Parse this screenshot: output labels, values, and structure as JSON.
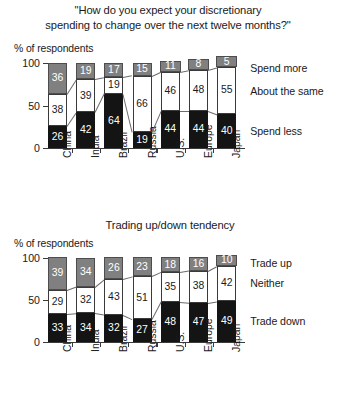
{
  "chart_data": [
    {
      "type": "bar",
      "id": "discretionary-spending",
      "title": "\"How do you expect your discretionary spending to change over the next twelve months?\"",
      "title_lines": [
        "\"How do you expect your discretionary",
        "spending to change over the next twelve months?\""
      ],
      "ylabel": "% of respondents",
      "xlabel": "",
      "ylim": [
        0,
        100
      ],
      "yticks": [
        0,
        50,
        100
      ],
      "ytick_labels": [
        "0",
        "50",
        "100"
      ],
      "grid": false,
      "stacked": true,
      "legend_position": "right",
      "categories": [
        "China",
        "India",
        "Brazil",
        "Russia",
        "U.S.",
        "Europe",
        "Japan"
      ],
      "series": [
        {
          "name": "Spend less",
          "color": "#141414",
          "values": [
            26,
            42,
            64,
            19,
            44,
            44,
            40
          ]
        },
        {
          "name": "About the same",
          "color": "#ffffff",
          "values": [
            38,
            39,
            19,
            66,
            46,
            48,
            55
          ]
        },
        {
          "name": "Spend more",
          "color": "#808080",
          "values": [
            36,
            19,
            17,
            15,
            11,
            8,
            5
          ]
        }
      ]
    },
    {
      "type": "bar",
      "id": "trading-tendency",
      "title": "Trading up/down tendency",
      "title_lines": [
        "Trading up/down tendency"
      ],
      "ylabel": "% of respondents",
      "xlabel": "",
      "ylim": [
        0,
        100
      ],
      "yticks": [
        0,
        50,
        100
      ],
      "ytick_labels": [
        "0",
        "50",
        "100"
      ],
      "grid": false,
      "stacked": true,
      "legend_position": "right",
      "categories": [
        "China",
        "India",
        "Brazil",
        "Russia",
        "U.S.",
        "Europe",
        "Japan"
      ],
      "series": [
        {
          "name": "Trade down",
          "color": "#141414",
          "values": [
            33,
            34,
            32,
            27,
            48,
            47,
            49
          ]
        },
        {
          "name": "Neither",
          "color": "#ffffff",
          "values": [
            29,
            32,
            43,
            51,
            35,
            38,
            42
          ]
        },
        {
          "name": "Trade up",
          "color": "#808080",
          "values": [
            39,
            34,
            26,
            23,
            18,
            16,
            10
          ]
        }
      ]
    }
  ]
}
